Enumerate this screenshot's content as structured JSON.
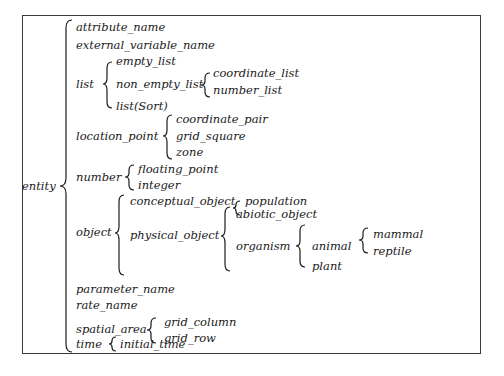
{
  "diagram": {
    "type": "taxonomy-brace-tree",
    "root": "entity",
    "nodes": {
      "entity": "entity",
      "attribute_name": "attribute_name",
      "external_variable_name": "external_variable_name",
      "list": "list",
      "empty_list": "empty_list",
      "non_empty_list": "non_empty_list",
      "coordinate_list": "coordinate_list",
      "number_list": "number_list",
      "list_sort": "list(Sort)",
      "location_point": "location_point",
      "coordinate_pair": "coordinate_pair",
      "grid_square": "grid_square",
      "zone": "zone",
      "number": "number",
      "floating_point": "floating_point",
      "integer": "integer",
      "object": "object",
      "conceptual_object": "conceptual_object",
      "population": "population",
      "physical_object": "physical_object",
      "abiotic_object": "abiotic_object",
      "organism": "organism",
      "animal": "animal",
      "mammal": "mammal",
      "reptile": "reptile",
      "plant": "plant",
      "parameter_name": "parameter_name",
      "rate_name": "rate_name",
      "spatial_area": "spatial_area",
      "grid_column": "grid_column",
      "grid_row": "grid_row",
      "time": "time",
      "initial_time": "initial_time"
    },
    "tree": {
      "entity": [
        "attribute_name",
        "external_variable_name",
        "list",
        "location_point",
        "number",
        "object",
        "parameter_name",
        "rate_name",
        "spatial_area",
        "time"
      ],
      "list": [
        "empty_list",
        "non_empty_list",
        "list(Sort)"
      ],
      "non_empty_list": [
        "coordinate_list",
        "number_list"
      ],
      "location_point": [
        "coordinate_pair",
        "grid_square",
        "zone"
      ],
      "number": [
        "floating_point",
        "integer"
      ],
      "object": [
        "conceptual_object",
        "physical_object"
      ],
      "conceptual_object": [
        "population"
      ],
      "physical_object": [
        "abiotic_object",
        "organism"
      ],
      "organism": [
        "animal",
        "plant"
      ],
      "animal": [
        "mammal",
        "reptile"
      ],
      "spatial_area": [
        "grid_column",
        "grid_row"
      ],
      "time": [
        "initial_time"
      ]
    },
    "colors": {
      "ink": "#1a1a1a",
      "frame": "#3a3a3a",
      "background": "#ffffff"
    }
  }
}
